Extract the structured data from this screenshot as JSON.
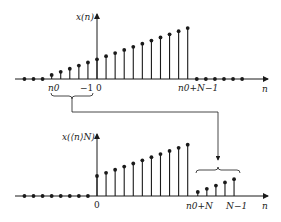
{
  "colors": {
    "ink": "#1a1a1a",
    "background": "#ffffff"
  },
  "top_plot": {
    "ylabel": "x(n)",
    "xlabel": "n",
    "tick_labels": {
      "start": "n0",
      "minus_one": "−1",
      "zero": "0",
      "end": "n0+N−1"
    },
    "zero_dots_left": 3,
    "stems_before_zero": 5,
    "stems_from_zero": 11,
    "zero_dots_right": 6
  },
  "bottom_plot": {
    "ylabel": "x(⟨n⟩N)",
    "xlabel": "n",
    "tick_labels": {
      "zero": "0",
      "wrap": "n0+N",
      "end": "N−1"
    },
    "zero_dots_left": 8,
    "tall_stems": 11,
    "wrapped_stems": 5
  },
  "annotation": {
    "description": "Samples n0..−1 of x(n) (bracketed) are circularly shifted to positions n0+N..N−1 in x(⟨n⟩N)"
  }
}
